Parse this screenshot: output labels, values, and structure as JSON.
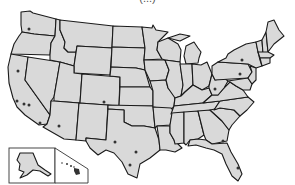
{
  "map": {
    "title_cropped": "(...)",
    "subject": "United States map",
    "fill_color": "#d9d9d9",
    "border_color": "#1a1a1a",
    "marker_color": "#333333",
    "insets": [
      "Alaska",
      "Hawaii"
    ],
    "markers": [
      {
        "state": "Washington",
        "x": 29,
        "y": 29
      },
      {
        "state": "California",
        "x": 18,
        "y": 71
      },
      {
        "state": "California",
        "x": 17,
        "y": 101
      },
      {
        "state": "California",
        "x": 24,
        "y": 104
      },
      {
        "state": "California",
        "x": 29,
        "y": 105
      },
      {
        "state": "California",
        "x": 40,
        "y": 123
      },
      {
        "state": "Arizona",
        "x": 59,
        "y": 126
      },
      {
        "state": "Colorado",
        "x": 104,
        "y": 102
      },
      {
        "state": "Texas",
        "x": 115,
        "y": 142
      },
      {
        "state": "Texas",
        "x": 136,
        "y": 152
      },
      {
        "state": "Texas",
        "x": 130,
        "y": 165
      },
      {
        "state": "New Mexico",
        "x": 104,
        "y": 102
      },
      {
        "state": "Oklahoma",
        "x": 104,
        "y": 102
      },
      {
        "state": "New York",
        "x": 242,
        "y": 60
      },
      {
        "state": "Pennsylvania",
        "x": 240,
        "y": 74
      },
      {
        "state": "Ohio",
        "x": 215,
        "y": 89
      },
      {
        "state": "Georgia",
        "x": 223,
        "y": 141
      },
      {
        "state": "Florida",
        "x": 238,
        "y": 168
      }
    ]
  }
}
